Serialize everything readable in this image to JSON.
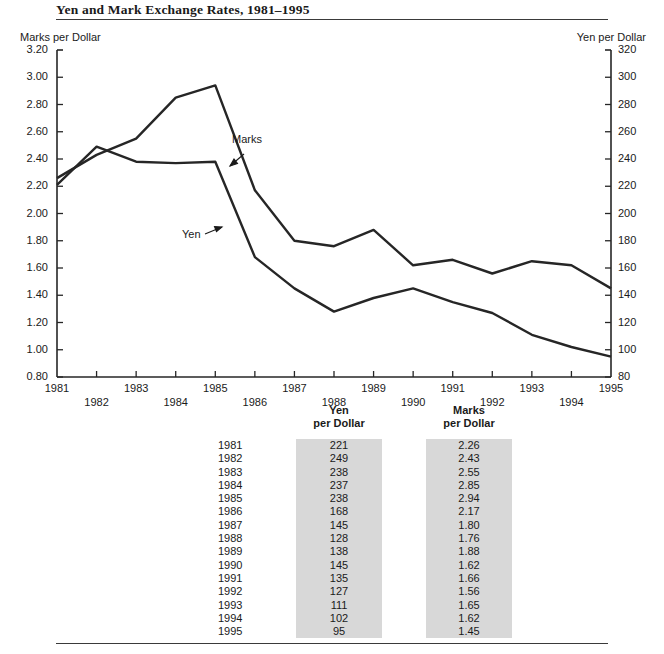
{
  "title": "Yen and Mark Exchange Rates, 1981–1995",
  "axes": {
    "left_caption": "Marks per Dollar",
    "right_caption": "Yen  per Dollar",
    "left_ticks": [
      "3.20",
      "3.00",
      "2.80",
      "2.60",
      "2.40",
      "2.20",
      "2.00",
      "1.80",
      "1.60",
      "1.40",
      "1.20",
      "1.00",
      "0.80"
    ],
    "right_ticks": [
      "320",
      "300",
      "280",
      "260",
      "240",
      "220",
      "200",
      "180",
      "160",
      "140",
      "120",
      "100",
      "80"
    ],
    "x_ticks": [
      "1981",
      "1982",
      "1983",
      "1984",
      "1985",
      "1986",
      "1987",
      "1988",
      "1989",
      "1990",
      "1991",
      "1992",
      "1993",
      "1994",
      "1995"
    ]
  },
  "series_labels": {
    "marks": "Marks",
    "yen": "Yen"
  },
  "table": {
    "headers": {
      "year": "",
      "yen_line1": "Yen",
      "yen_line2": "per Dollar",
      "marks_line1": "Marks",
      "marks_line2": "per Dollar"
    },
    "rows": [
      {
        "year": "1981",
        "yen": "221",
        "marks": "2.26"
      },
      {
        "year": "1982",
        "yen": "249",
        "marks": "2.43"
      },
      {
        "year": "1983",
        "yen": "238",
        "marks": "2.55"
      },
      {
        "year": "1984",
        "yen": "237",
        "marks": "2.85"
      },
      {
        "year": "1985",
        "yen": "238",
        "marks": "2.94"
      },
      {
        "year": "1986",
        "yen": "168",
        "marks": "2.17"
      },
      {
        "year": "1987",
        "yen": "145",
        "marks": "1.80"
      },
      {
        "year": "1988",
        "yen": "128",
        "marks": "1.76"
      },
      {
        "year": "1989",
        "yen": "138",
        "marks": "1.88"
      },
      {
        "year": "1990",
        "yen": "145",
        "marks": "1.62"
      },
      {
        "year": "1991",
        "yen": "135",
        "marks": "1.66"
      },
      {
        "year": "1992",
        "yen": "127",
        "marks": "1.56"
      },
      {
        "year": "1993",
        "yen": "111",
        "marks": "1.65"
      },
      {
        "year": "1994",
        "yen": "102",
        "marks": "1.62"
      },
      {
        "year": "1995",
        "yen": "95",
        "marks": "1.45"
      }
    ]
  },
  "chart_data": {
    "type": "line",
    "title": "Yen and Mark Exchange Rates, 1981–1995",
    "xlabel": "",
    "ylabel": "Marks per Dollar",
    "y2label": "Yen  per Dollar",
    "x": [
      1981,
      1982,
      1983,
      1984,
      1985,
      1986,
      1987,
      1988,
      1989,
      1990,
      1991,
      1992,
      1993,
      1994,
      1995
    ],
    "xlim": [
      1981,
      1995
    ],
    "ylim": [
      0.8,
      3.2
    ],
    "y2lim": [
      80,
      320
    ],
    "grid": false,
    "legend": "inline-annotation",
    "series": [
      {
        "name": "Marks",
        "axis": "left",
        "unit": "Marks per Dollar",
        "values": [
          2.26,
          2.43,
          2.55,
          2.85,
          2.94,
          2.17,
          1.8,
          1.76,
          1.88,
          1.62,
          1.66,
          1.56,
          1.65,
          1.62,
          1.45
        ]
      },
      {
        "name": "Yen",
        "axis": "right",
        "unit": "Yen per Dollar",
        "values": [
          221,
          249,
          238,
          237,
          238,
          168,
          145,
          128,
          138,
          145,
          135,
          127,
          111,
          102,
          95
        ]
      }
    ],
    "annotations": [
      {
        "text": "Marks",
        "x": 1985.1,
        "y": 2.78
      },
      {
        "text": "Yen",
        "x": 1983.6,
        "y": 2.03
      }
    ],
    "colors": {
      "line": "#262626",
      "table_cell_shade": "#d8d8d8",
      "rule": "#3a3a3a"
    }
  }
}
